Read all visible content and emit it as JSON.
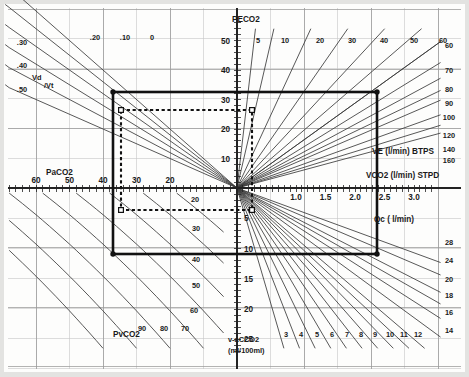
{
  "chart_data": {
    "type": "line",
    "subtitle": "",
    "grid": true,
    "legend_position": "none",
    "layout": {
      "origin_px": [
        237,
        188
      ],
      "width_px": 469,
      "height_px": 377,
      "quadrants": [
        "upper-left: PaCO2 vs PECO2 with Vd/Vt fan",
        "upper-right: VCO2 vs PECO2 with VE (l/min) BTPS fan",
        "lower-left: PaCO2 vs v-aCCO2 with PvCO2 curves",
        "lower-right: VCO2 vs v-aCCO2 with Qc (l/min) fan"
      ]
    },
    "axes": [
      {
        "name": "PaCO2",
        "label": "PaCO2",
        "position": "left-horizontal",
        "direction": "right-to-left",
        "ticks": [
          20,
          30,
          40,
          50,
          60
        ],
        "tick_labels": [
          "20",
          "30",
          "40",
          "50",
          "60"
        ],
        "range": [
          0,
          70
        ]
      },
      {
        "name": "VCO2",
        "label": "VCO2 (l/min) STPD",
        "position": "right-horizontal",
        "direction": "left-to-right",
        "ticks": [
          1.0,
          1.5,
          2.0,
          2.5,
          3.0
        ],
        "tick_labels": [
          "1.0",
          "1.5",
          "2.0",
          "2.5",
          "3.0"
        ],
        "range": [
          0,
          3.4
        ]
      },
      {
        "name": "PECO2",
        "label": "PECO2",
        "position": "upper-vertical",
        "direction": "bottom-to-top",
        "ticks": [
          10,
          20,
          30,
          40,
          50
        ],
        "tick_labels": [
          "10",
          "20",
          "30",
          "40",
          "50"
        ],
        "range": [
          0,
          56
        ]
      },
      {
        "name": "v-aCCO2",
        "label": "v-aCCO2",
        "sublabel": "(ml/100ml)",
        "position": "lower-vertical",
        "direction": "top-to-bottom",
        "ticks": [
          5,
          10,
          15,
          20,
          25
        ],
        "tick_labels": [
          "5",
          "10",
          "15",
          "20",
          "25"
        ],
        "range": [
          0,
          27
        ]
      }
    ],
    "families": [
      {
        "name": "Vd/Vt",
        "label": "Vd/Vt",
        "quadrant": "upper-left",
        "style": "straight-fan",
        "values": [
          0,
          0.1,
          0.2,
          0.3,
          0.4,
          0.5
        ],
        "value_labels": [
          "0",
          ".10",
          ".20",
          ".30",
          ".40",
          ".50"
        ],
        "label_sides": [
          "top",
          "top",
          "top",
          "left",
          "left",
          "left"
        ]
      },
      {
        "name": "VE",
        "label": "VE (l/min) BTPS",
        "quadrant": "upper-right",
        "style": "straight-fan",
        "top_values": [
          5,
          10,
          20,
          30,
          40,
          50,
          60
        ],
        "top_value_labels": [
          "5",
          "10",
          "20",
          "30",
          "40",
          "50",
          "60"
        ],
        "right_values": [
          60,
          70,
          80,
          90,
          100,
          120,
          140,
          160
        ],
        "right_value_labels": [
          "60",
          "70",
          "80",
          "90",
          "100",
          "120",
          "140",
          "160"
        ]
      },
      {
        "name": "PvCO2",
        "label": "PvCO2",
        "quadrant": "lower-left",
        "style": "curve-family",
        "values": [
          20,
          30,
          40,
          50,
          60,
          70,
          80,
          90
        ],
        "value_labels": [
          "20",
          "30",
          "40",
          "50",
          "60",
          "70",
          "80",
          "90"
        ]
      },
      {
        "name": "Qc",
        "label": "Qc ( l/min)",
        "quadrant": "lower-right",
        "style": "straight-fan",
        "bottom_values": [
          3,
          4,
          5,
          6,
          7,
          8,
          9,
          10,
          11,
          12
        ],
        "bottom_value_labels": [
          "3",
          "4",
          "5",
          "6",
          "7",
          "8",
          "9",
          "10",
          "11",
          "12"
        ],
        "right_values": [
          14,
          16,
          18,
          20,
          24,
          28
        ],
        "right_value_labels": [
          "14",
          "16",
          "18",
          "20",
          "24",
          "28"
        ]
      }
    ],
    "annotations": [
      {
        "name": "solid-box",
        "kind": "rectangle",
        "style": "solid-thick",
        "corner_markers": true,
        "px": {
          "x": 113,
          "y": 92,
          "w": 264,
          "h": 162
        },
        "reads": {
          "PaCO2": 40,
          "PECO2": 35,
          "VCO2": 2.3,
          "v_aCCO2": 10.5
        }
      },
      {
        "name": "dashed-box",
        "kind": "rectangle",
        "style": "dashed-thick",
        "corner_markers": true,
        "px": {
          "x": 121,
          "y": 110,
          "w": 131,
          "h": 100
        },
        "reads": {
          "PaCO2": 40,
          "PECO2": 28,
          "VCO2": 0.25,
          "v_aCCO2": 5.0
        }
      }
    ],
    "colors": {
      "background": "#fdfdfc",
      "grid_major": "#9a9a9a",
      "grid_minor": "#c6c6c6",
      "curve": "#3a3a3a",
      "axis": "#222222",
      "annotation": "#111111",
      "page_edge": "#e3e3e1"
    }
  },
  "labels": {
    "paco2": "PaCO2",
    "peco2": "PECO2",
    "vco2": "VCO2 (l/min) STPD",
    "ve": "VE (l/min) BTPS",
    "qc": "Qc ( l/min)",
    "pvco2": "PvCO2",
    "vdvt_vd": "Vd",
    "vdvt_vt": "Vt",
    "vaccO2": "v-aCCO2",
    "vaccO2_units": "(ml /100 ml)"
  }
}
